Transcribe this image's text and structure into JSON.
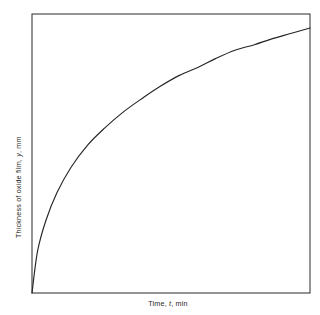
{
  "figure": {
    "background_color": "#ffffff",
    "frame_color": "#2b2b2b",
    "curve_color": "#262626"
  },
  "axes": {
    "y_label_parts": {
      "prefix": "Thickness of oxide film, ",
      "variable": "y",
      "suffix": ", mm"
    },
    "x_label_parts": {
      "prefix": "Time, ",
      "variable": "t",
      "suffix": ", min"
    },
    "y_label_full": "Thickness of oxide film, y, mm",
    "x_label_full": "Time, t, min"
  },
  "chart_data": {
    "type": "line",
    "title": "",
    "xlabel": "Time, t, min",
    "ylabel": "Thickness of oxide film, y, mm",
    "xlim": [
      0,
      1
    ],
    "ylim": [
      0,
      1
    ],
    "grid": false,
    "legend": "none",
    "ticks": {
      "x_tick_labels": [],
      "y_tick_labels": [],
      "tick_marks": false
    },
    "annotations": [],
    "series": [
      {
        "name": "Oxide film growth",
        "description": "Monotonically increasing concave-down parabolic growth curve, steep near the origin and flattening toward the right; terminates short of the right frame edge.",
        "x": [
          0.0,
          0.02,
          0.05,
          0.09,
          0.14,
          0.2,
          0.26,
          0.33,
          0.4,
          0.46,
          0.53,
          0.6,
          0.66,
          0.73,
          0.8,
          0.86,
          0.93,
          1.0
        ],
        "y": [
          0.0,
          0.15,
          0.26,
          0.36,
          0.45,
          0.53,
          0.59,
          0.65,
          0.7,
          0.74,
          0.78,
          0.81,
          0.84,
          0.87,
          0.89,
          0.91,
          0.93,
          0.95
        ]
      }
    ]
  }
}
